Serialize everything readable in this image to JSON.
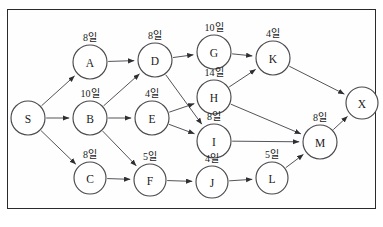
{
  "diagram": {
    "frame": {
      "border_color": "#2b2b2f"
    },
    "duration_unit": "일",
    "nodes": [
      {
        "id": "S",
        "label": "S",
        "duration": "",
        "x": 28,
        "y": 118,
        "r": 17
      },
      {
        "id": "A",
        "label": "A",
        "duration": "8일",
        "x": 90,
        "y": 62,
        "r": 17
      },
      {
        "id": "B",
        "label": "B",
        "duration": "10일",
        "x": 90,
        "y": 118,
        "r": 17
      },
      {
        "id": "C",
        "label": "C",
        "duration": "8일",
        "x": 90,
        "y": 178,
        "r": 16
      },
      {
        "id": "D",
        "label": "D",
        "duration": "8일",
        "x": 155,
        "y": 60,
        "r": 17
      },
      {
        "id": "E",
        "label": "E",
        "duration": "4일",
        "x": 152,
        "y": 118,
        "r": 17
      },
      {
        "id": "F",
        "label": "F",
        "duration": "5일",
        "x": 150,
        "y": 180,
        "r": 16
      },
      {
        "id": "G",
        "label": "G",
        "duration": "10일",
        "x": 214,
        "y": 52,
        "r": 17
      },
      {
        "id": "H",
        "label": "H",
        "duration": "14일",
        "x": 214,
        "y": 97,
        "r": 17
      },
      {
        "id": "I",
        "label": "I",
        "duration": "8일",
        "x": 214,
        "y": 141,
        "r": 17
      },
      {
        "id": "J",
        "label": "J",
        "duration": "4일",
        "x": 212,
        "y": 182,
        "r": 16
      },
      {
        "id": "K",
        "label": "K",
        "duration": "4일",
        "x": 273,
        "y": 58,
        "r": 17
      },
      {
        "id": "L",
        "label": "L",
        "duration": "5일",
        "x": 272,
        "y": 178,
        "r": 16
      },
      {
        "id": "M",
        "label": "M",
        "duration": "8일",
        "x": 320,
        "y": 142,
        "r": 17
      },
      {
        "id": "X",
        "label": "X",
        "duration": "",
        "x": 362,
        "y": 103,
        "r": 16
      }
    ],
    "edges": [
      {
        "from": "S",
        "to": "A"
      },
      {
        "from": "S",
        "to": "B"
      },
      {
        "from": "S",
        "to": "C"
      },
      {
        "from": "A",
        "to": "D"
      },
      {
        "from": "B",
        "to": "D"
      },
      {
        "from": "B",
        "to": "E"
      },
      {
        "from": "B",
        "to": "F"
      },
      {
        "from": "C",
        "to": "F"
      },
      {
        "from": "D",
        "to": "G"
      },
      {
        "from": "D",
        "to": "I"
      },
      {
        "from": "E",
        "to": "H"
      },
      {
        "from": "E",
        "to": "I"
      },
      {
        "from": "F",
        "to": "J"
      },
      {
        "from": "G",
        "to": "K"
      },
      {
        "from": "H",
        "to": "K"
      },
      {
        "from": "H",
        "to": "M"
      },
      {
        "from": "I",
        "to": "M"
      },
      {
        "from": "J",
        "to": "L"
      },
      {
        "from": "K",
        "to": "X"
      },
      {
        "from": "L",
        "to": "M"
      },
      {
        "from": "M",
        "to": "X"
      }
    ]
  }
}
